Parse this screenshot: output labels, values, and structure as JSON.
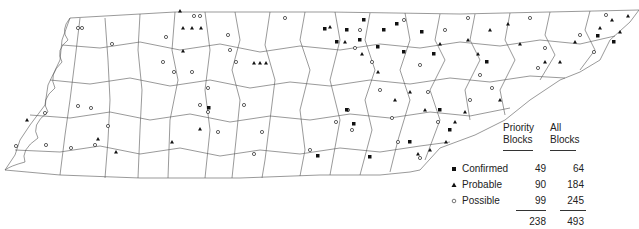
{
  "map": {
    "region": "Tennessee counties",
    "symbols": {
      "confirmed": "filled-square",
      "probable": "filled-triangle",
      "possible": "open-circle"
    }
  },
  "legend": {
    "col_priority": [
      "Priority",
      "Blocks"
    ],
    "col_all": [
      "All",
      "Blocks"
    ],
    "rows": [
      {
        "label": "Confirmed",
        "symbol": "confirmed",
        "priority": "49",
        "all": "64"
      },
      {
        "label": "Probable",
        "symbol": "probable",
        "priority": "90",
        "all": "184"
      },
      {
        "label": "Possible",
        "symbol": "possible",
        "priority": "99",
        "all": "245"
      }
    ],
    "totals": {
      "priority": "238",
      "all": "493"
    }
  }
}
